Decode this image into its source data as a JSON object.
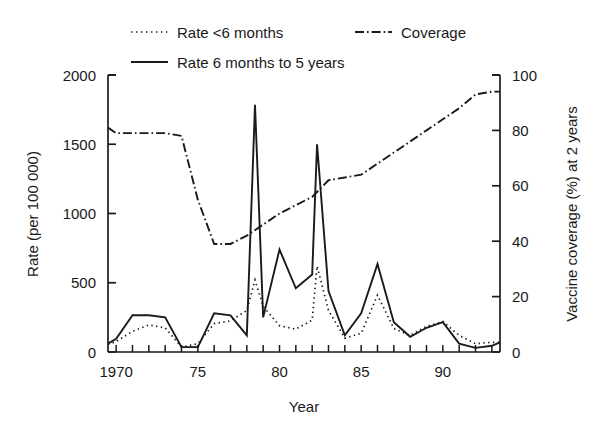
{
  "chart_data": {
    "type": "line",
    "title": "",
    "xlabel": "Year",
    "ylabel": "Rate (per 100 000)",
    "y2label": "Vaccine coverage (%) at 2 years",
    "xlim": [
      1969.5,
      1993.5
    ],
    "ylim": [
      0,
      2000
    ],
    "y2lim": [
      0,
      100
    ],
    "xticks": [
      1970,
      1975,
      1980,
      1985,
      1990
    ],
    "xticklabels": [
      "1970",
      "75",
      "80",
      "85",
      "90"
    ],
    "yticks": [
      0,
      500,
      1000,
      1500,
      2000
    ],
    "yticklabels": [
      "0",
      "500",
      "1000",
      "1500",
      "2000"
    ],
    "y2ticks": [
      0,
      20,
      40,
      60,
      80,
      100
    ],
    "y2ticklabels": [
      "0",
      "20",
      "40",
      "60",
      "80",
      "100"
    ],
    "minor_xtick_interval": 1,
    "grid": false,
    "legend_position": "above-plot",
    "series": [
      {
        "name": "Rate <6 months",
        "axis": "left",
        "style": "dotted",
        "x": [
          1969.5,
          1970,
          1971,
          1972,
          1973,
          1974,
          1975,
          1976,
          1977,
          1978,
          1978.5,
          1979,
          1980,
          1981,
          1982,
          1982.3,
          1983,
          1984,
          1985,
          1986,
          1987,
          1988,
          1989,
          1990,
          1991,
          1992,
          1993,
          1993.5
        ],
        "y": [
          55,
          75,
          150,
          195,
          175,
          35,
          60,
          205,
          225,
          300,
          520,
          330,
          190,
          165,
          230,
          620,
          300,
          100,
          135,
          410,
          170,
          120,
          185,
          220,
          120,
          60,
          70,
          70
        ]
      },
      {
        "name": "Rate 6 months to 5 years",
        "axis": "left",
        "style": "solid",
        "x": [
          1969.5,
          1970,
          1971,
          1972,
          1973,
          1974,
          1975,
          1976,
          1977,
          1978,
          1978.5,
          1979,
          1980,
          1981,
          1982,
          1982.3,
          1983,
          1984,
          1985,
          1986,
          1987,
          1988,
          1989,
          1990,
          1991,
          1992,
          1993,
          1993.5
        ],
        "y": [
          60,
          95,
          265,
          265,
          250,
          35,
          35,
          280,
          265,
          120,
          1785,
          250,
          740,
          460,
          560,
          1500,
          440,
          120,
          280,
          635,
          215,
          110,
          175,
          215,
          60,
          30,
          45,
          70
        ]
      },
      {
        "name": "Coverage",
        "axis": "right",
        "style": "dash-dot",
        "x": [
          1969.5,
          1970,
          1971,
          1972,
          1973,
          1974,
          1975,
          1976,
          1977,
          1978,
          1979,
          1980,
          1981,
          1982,
          1983,
          1984,
          1985,
          1986,
          1987,
          1988,
          1989,
          1990,
          1991,
          1992,
          1993,
          1993.5
        ],
        "y": [
          81,
          79,
          79,
          79,
          79,
          78,
          55,
          39,
          39,
          42,
          46,
          50,
          53,
          56,
          62,
          63,
          64,
          68,
          72,
          76,
          80,
          84,
          88,
          93,
          94,
          94
        ]
      }
    ],
    "colors": {
      "line": "#1a1a1a",
      "axis": "#1a1a1a",
      "background": "#ffffff"
    }
  },
  "legend": {
    "items": [
      {
        "label": "Rate <6 months",
        "style": "dotted"
      },
      {
        "label": "Coverage",
        "style": "dash-dot"
      },
      {
        "label": "Rate 6 months to 5 years",
        "style": "solid"
      }
    ]
  }
}
